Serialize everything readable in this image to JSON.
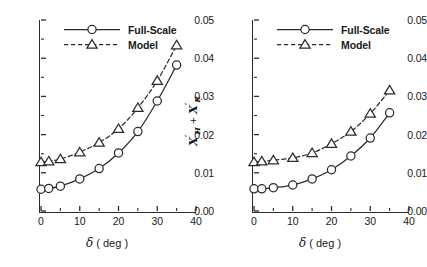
{
  "figure": {
    "panels": [
      {
        "name": "left-panel",
        "xlabel_symbol": "δ",
        "xlabel_unit": "( deg )",
        "ylabel_visible": true,
        "xticks": [
          "0",
          "10",
          "20",
          "30",
          "40"
        ],
        "yticks": [
          "0.00",
          "0.01",
          "0.02",
          "0.03",
          "0.04",
          "0.05"
        ],
        "legend": [
          {
            "label": "Full-Scale",
            "marker": "circle",
            "line": "solid"
          },
          {
            "label": "Model",
            "marker": "triangle",
            "line": "dashed"
          }
        ]
      },
      {
        "name": "right-panel",
        "xlabel_symbol": "δ",
        "xlabel_unit": "( deg )",
        "ylabel_visible": false,
        "xticks": [
          "0",
          "10",
          "20",
          "30",
          "40"
        ],
        "yticks": [
          "0.00",
          "0.01",
          "0.02",
          "0.03",
          "0.04",
          "0.05"
        ],
        "legend": [
          {
            "label": "Full-Scale",
            "marker": "circle",
            "line": "solid"
          },
          {
            "label": "Model",
            "marker": "triangle",
            "line": "dashed"
          }
        ]
      }
    ],
    "ylabel": {
      "x": "X",
      "sub_h": "H",
      "sub_r": "R",
      "plus": "+",
      "prime": "′"
    }
  },
  "chart_data": [
    {
      "type": "line",
      "title": "",
      "panel": "left",
      "xlabel": "δ ( deg )",
      "ylabel": "X'_H + X'_R",
      "xlim": [
        0,
        40
      ],
      "ylim": [
        0,
        0.05
      ],
      "xticks": [
        0,
        10,
        20,
        30,
        40
      ],
      "yticks": [
        0,
        0.01,
        0.02,
        0.03,
        0.04,
        0.05
      ],
      "xminor_ticks": [
        5,
        15,
        25,
        35
      ],
      "yminor_ticks": [
        0.005,
        0.015,
        0.025,
        0.035,
        0.045
      ],
      "grid": false,
      "legend_position": "top-center",
      "x": [
        0,
        2,
        5,
        10,
        15,
        20,
        25,
        30,
        35
      ],
      "series": [
        {
          "name": "Full-Scale",
          "marker": "circle",
          "line": "solid",
          "values": [
            0.0057,
            0.0059,
            0.0065,
            0.0084,
            0.0111,
            0.0152,
            0.0208,
            0.0288,
            0.0382
          ]
        },
        {
          "name": "Model",
          "marker": "triangle",
          "line": "dashed",
          "values": [
            0.0128,
            0.013,
            0.0136,
            0.0154,
            0.0179,
            0.0215,
            0.027,
            0.0341,
            0.0434
          ]
        }
      ]
    },
    {
      "type": "line",
      "title": "",
      "panel": "right",
      "xlabel": "δ ( deg )",
      "ylabel": "X'_H + X'_R",
      "xlim": [
        0,
        40
      ],
      "ylim": [
        0,
        0.05
      ],
      "xticks": [
        0,
        10,
        20,
        30,
        40
      ],
      "yticks": [
        0,
        0.01,
        0.02,
        0.03,
        0.04,
        0.05
      ],
      "xminor_ticks": [
        5,
        15,
        25,
        35
      ],
      "yminor_ticks": [
        0.005,
        0.015,
        0.025,
        0.035,
        0.045
      ],
      "grid": false,
      "legend_position": "top-center",
      "x": [
        0,
        2,
        5,
        10,
        15,
        20,
        25,
        30,
        35
      ],
      "series": [
        {
          "name": "Full-Scale",
          "marker": "circle",
          "line": "solid",
          "values": [
            0.0058,
            0.0058,
            0.0061,
            0.0068,
            0.0084,
            0.0108,
            0.0144,
            0.0191,
            0.0257
          ]
        },
        {
          "name": "Model",
          "marker": "triangle",
          "line": "dashed",
          "values": [
            0.0128,
            0.013,
            0.0133,
            0.0139,
            0.0152,
            0.0176,
            0.0208,
            0.0255,
            0.0316
          ]
        }
      ]
    }
  ]
}
